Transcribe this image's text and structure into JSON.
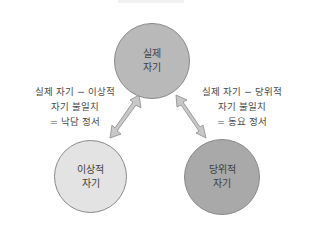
{
  "diagram": {
    "nodes": {
      "actual": {
        "line1": "실제",
        "line2": "자기",
        "color": "#b9b9b9"
      },
      "ideal": {
        "line1": "이상적",
        "line2": "자기",
        "color": "#e3e3e3"
      },
      "ought": {
        "line1": "당위적",
        "line2": "자기",
        "color": "#a9a9a9"
      }
    },
    "edges": {
      "actual_ideal": {
        "line1": "실제 자기 − 이상적",
        "line2": "자기 불일치",
        "line3": "= 낙담 정서"
      },
      "actual_ought": {
        "line1": "실제 자기 − 당위적",
        "line2": "자기 불일치",
        "line3": "= 동요 정서"
      }
    },
    "arrow_color": "#c8c8c8",
    "arrow_stroke": "#8a8a8a"
  }
}
